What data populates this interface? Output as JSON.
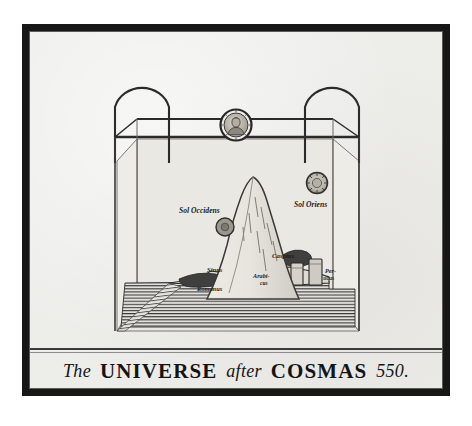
{
  "plate": {
    "title_caption": {
      "the": "The",
      "universe": "UNIVERSE",
      "after": "after",
      "cosmas": "COSMAS",
      "year": "550."
    },
    "medium": "engraving",
    "paper_color": "#ededea",
    "ink_color": "#1d1d1d",
    "frame_color": "#171717"
  },
  "diagram": {
    "type": "cosmological-schematic",
    "structure": {
      "vault": "arched firmament over rectangular box",
      "corner_posts": 2,
      "arches": 2,
      "floor": "flat earth with encircling ocean"
    },
    "labels": [
      {
        "id": "sol-occidens",
        "text": "Sol Occidens",
        "meaning": "setting sun",
        "x": 186,
        "y": 179
      },
      {
        "id": "sol-oriens",
        "text": "Sol Oriens",
        "meaning": "rising sun",
        "x": 290,
        "y": 172
      },
      {
        "id": "caspius",
        "text": "Caspius",
        "meaning": "Caspian gulf",
        "x": 265,
        "y": 224
      },
      {
        "id": "sinus",
        "text": "Sinus",
        "meaning": "gulf",
        "x": 203,
        "y": 239
      },
      {
        "id": "romanus",
        "text": "Romanus",
        "meaning": "Roman gulf (Mediterranean)",
        "x": 207,
        "y": 258
      },
      {
        "id": "arabicus-1",
        "text": "Arabi-",
        "meaning": "Arabian gulf (Red Sea)",
        "x": 243,
        "y": 246
      },
      {
        "id": "arabicus-2",
        "text": "cus",
        "meaning": "Arabian gulf, second line",
        "x": 247,
        "y": 254
      },
      {
        "id": "persicus-1",
        "text": "Per-",
        "meaning": "Persian gulf",
        "x": 298,
        "y": 241
      },
      {
        "id": "persicus-2",
        "text": "sicus",
        "meaning": "Persian gulf, second line",
        "x": 297,
        "y": 249
      }
    ],
    "features": {
      "medallion": "bearded figure of Christ in roundel at apex of firmament",
      "sun_disc": "radiant sun disc at east",
      "sun_disc_west": "sun disc partly behind mountain at west",
      "mountain": "great conical world-mountain at centre",
      "ocean": "horizontally hatched encircling sea",
      "towers": 2
    }
  }
}
